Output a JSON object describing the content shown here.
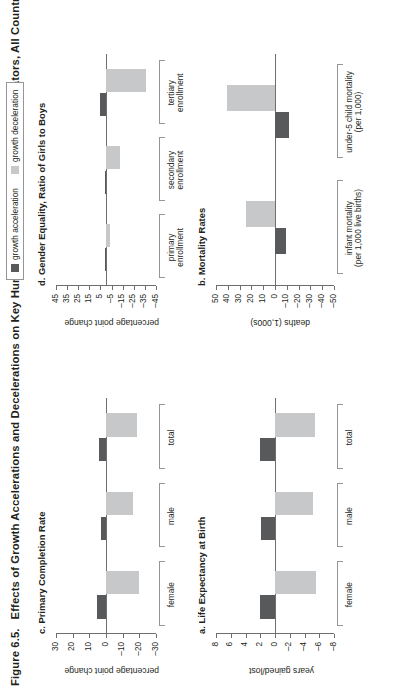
{
  "figure": {
    "number": "Figure 6.5.",
    "title": "Effects of Growth Accelerations and Decelerations on Key Human Development and Gender Indicators, All Countries"
  },
  "legend": {
    "items": [
      {
        "label": "growth acceleration",
        "color": "#58595b",
        "key": "accel"
      },
      {
        "label": "growth deceleration",
        "color": "#c7c8ca",
        "key": "decel"
      }
    ]
  },
  "chart_data": [
    {
      "type": "bar",
      "panel": "a",
      "title": "a. Life Expectancy at Birth",
      "ylabel": "years gained/lost",
      "xlabel": "",
      "categories": [
        "female",
        "male",
        "total"
      ],
      "category_lines": [
        [
          "female"
        ],
        [
          "male"
        ],
        [
          "total"
        ]
      ],
      "series": [
        {
          "name": "growth acceleration",
          "color": "#58595b",
          "values": [
            2.1,
            1.9,
            2.0
          ]
        },
        {
          "name": "growth deceleration",
          "color": "#c7c8ca",
          "values": [
            -5.6,
            -5.2,
            -5.4
          ]
        }
      ],
      "yticks": [
        8,
        6,
        4,
        2,
        0,
        -2,
        -4,
        -6,
        -8
      ],
      "ylim": [
        -8,
        8
      ],
      "grid": false
    },
    {
      "type": "bar",
      "panel": "b",
      "title": "b. Mortality Rates",
      "ylabel": "deaths (1,000s)",
      "xlabel": "",
      "categories": [
        "infant mortality (per 1,000 live births)",
        "under-5 child mortality (per 1,000)"
      ],
      "category_lines": [
        [
          "infant mortality",
          "(per 1,000 live births)"
        ],
        [
          "under-5 child mortality",
          "(per 1,000)"
        ]
      ],
      "series": [
        {
          "name": "growth acceleration",
          "color": "#58595b",
          "values": [
            -9.0,
            -11.5
          ]
        },
        {
          "name": "growth deceleration",
          "color": "#c7c8ca",
          "values": [
            25.0,
            41.0
          ]
        }
      ],
      "yticks": [
        50,
        40,
        30,
        20,
        10,
        0,
        -10,
        -20,
        -30,
        -40,
        -50
      ],
      "ylim": [
        -50,
        50
      ],
      "grid": false
    },
    {
      "type": "bar",
      "panel": "c",
      "title": "c. Primary Completion Rate",
      "ylabel": "percentage point change",
      "xlabel": "",
      "categories": [
        "female",
        "male",
        "total"
      ],
      "category_lines": [
        [
          "female"
        ],
        [
          "male"
        ],
        [
          "total"
        ]
      ],
      "series": [
        {
          "name": "growth acceleration",
          "color": "#58595b",
          "values": [
            5.5,
            3.0,
            4.5
          ]
        },
        {
          "name": "growth deceleration",
          "color": "#c7c8ca",
          "values": [
            -20.0,
            -16.0,
            -18.5
          ]
        }
      ],
      "yticks": [
        30,
        20,
        10,
        0,
        -10,
        -20,
        -30
      ],
      "ylim": [
        -30,
        30
      ],
      "grid": false
    },
    {
      "type": "bar",
      "panel": "d",
      "title": "d. Gender Equality, Ratio of Girls to Boys",
      "ylabel": "percentage point change",
      "xlabel": "",
      "categories": [
        "primary enrollment",
        "secondary enrollment",
        "tertiary enrollment"
      ],
      "category_lines": [
        [
          "primary",
          "enrollment"
        ],
        [
          "secondary",
          "enrollment"
        ],
        [
          "tertiary",
          "enrollment"
        ]
      ],
      "series": [
        {
          "name": "growth acceleration",
          "color": "#58595b",
          "values": [
            1.0,
            1.0,
            5.0
          ]
        },
        {
          "name": "growth deceleration",
          "color": "#c7c8ca",
          "values": [
            -4.0,
            -13.0,
            -36.0
          ]
        }
      ],
      "yticks": [
        45,
        35,
        25,
        15,
        5,
        -5,
        -15,
        -25,
        -35,
        -45
      ],
      "ylim": [
        -45,
        45
      ],
      "grid": false
    }
  ]
}
